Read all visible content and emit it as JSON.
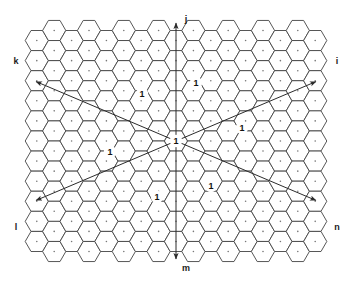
{
  "figure": {
    "background_color": "#ffffff",
    "width": 352,
    "height": 284
  },
  "grid": {
    "hexagon_orientation": "flat-top",
    "outline_color": "#444444",
    "outline_width": 0.9,
    "fill_color": "#ffffff",
    "center_dot_color": "#777777",
    "hex_radius": 11.6,
    "columns": 17,
    "rows": 10,
    "origin_x": 176,
    "origin_y": 141,
    "x_min": 27,
    "x_max": 319,
    "y_min": 31,
    "y_max": 253
  },
  "axes": {
    "arrow_color": "#2b2b2b",
    "arrow_width": 1.0,
    "origin_label": "1",
    "directions": [
      {
        "name": "j",
        "label": "j",
        "angle_deg": 90,
        "length": 118,
        "label_x": 186,
        "label_y": 20
      },
      {
        "name": "i",
        "label": "i",
        "angle_deg": 23,
        "length": 152,
        "label_x": 337,
        "label_y": 62
      },
      {
        "name": "n",
        "label": "n",
        "angle_deg": -23,
        "length": 152,
        "label_x": 337,
        "label_y": 228
      },
      {
        "name": "m",
        "label": "m",
        "angle_deg": -90,
        "length": 118,
        "label_x": 186,
        "label_y": 269
      },
      {
        "name": "l",
        "label": "l",
        "angle_deg": -157,
        "length": 152,
        "label_x": 16,
        "label_y": 228
      },
      {
        "name": "k",
        "label": "k",
        "angle_deg": 157,
        "length": 152,
        "label_x": 16,
        "label_y": 62
      }
    ]
  },
  "chart_data": {
    "type": "diagram",
    "center_cell": {
      "label": "1",
      "x": 176,
      "y": 141
    },
    "labeled_cells": [
      {
        "label": "1",
        "x": 196,
        "y": 83
      },
      {
        "label": "1",
        "x": 142,
        "y": 94
      },
      {
        "label": "1",
        "x": 242,
        "y": 128
      },
      {
        "label": "1",
        "x": 110,
        "y": 152
      },
      {
        "label": "1",
        "x": 211,
        "y": 186
      },
      {
        "label": "1",
        "x": 157,
        "y": 197
      }
    ],
    "axis_labels": [
      "j",
      "i",
      "n",
      "m",
      "l",
      "k"
    ]
  }
}
